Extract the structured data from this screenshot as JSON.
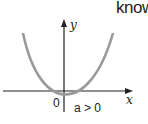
{
  "header": {
    "partial_text": "know"
  },
  "diagram": {
    "type": "parabola-graph",
    "axes": {
      "x_label": "x",
      "y_label": "y",
      "origin_label": "0"
    },
    "condition": "a > 0",
    "curve_color": "#9a9a9a",
    "axis_color": "#222222"
  }
}
